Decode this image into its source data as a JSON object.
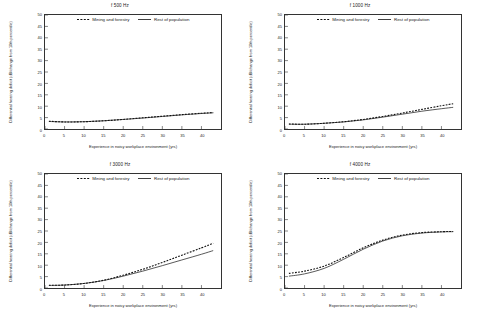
{
  "figure": {
    "legend": {
      "mining_label": "Mining and forestry",
      "rest_label": "Rest of population"
    },
    "axis": {
      "xlabel": "Experience in noisy workplace environment (yrs)",
      "ylabel": "Differential hearing deficit (dB/change from 10th percentile)",
      "xticks": [
        "0",
        "5",
        "10",
        "15",
        "20",
        "25",
        "30",
        "35",
        "40"
      ],
      "yticks": [
        "0",
        "5",
        "10",
        "15",
        "20",
        "25",
        "30",
        "35",
        "40",
        "45",
        "50"
      ]
    },
    "colors": {
      "line": "#111111",
      "frame": "#333333",
      "text": "#222222"
    }
  },
  "chart_data": [
    {
      "type": "line",
      "title": "f 500 Hz",
      "xlabel": "Experience in noisy workplace environment (yrs)",
      "ylabel": "Differential hearing deficit (dB/change from 10th percentile)",
      "xlim": [
        0,
        45
      ],
      "ylim": [
        0,
        50
      ],
      "grid": false,
      "legend_position": "top-center",
      "x": [
        1,
        5,
        10,
        15,
        20,
        25,
        30,
        35,
        40,
        43
      ],
      "series": [
        {
          "name": "Mining and forestry",
          "style": "dashed",
          "values": [
            3.4,
            3.1,
            3.2,
            3.6,
            4.2,
            4.9,
            5.6,
            6.3,
            6.9,
            7.2
          ]
        },
        {
          "name": "Rest of population",
          "style": "solid",
          "values": [
            3.3,
            3.1,
            3.2,
            3.6,
            4.2,
            4.8,
            5.5,
            6.2,
            6.8,
            7.1
          ]
        }
      ]
    },
    {
      "type": "line",
      "title": "f 1000 Hz",
      "xlabel": "Experience in noisy workplace environment (yrs)",
      "ylabel": "Differential hearing deficit (dB/change from 10th percentile)",
      "xlim": [
        0,
        45
      ],
      "ylim": [
        0,
        50
      ],
      "grid": false,
      "legend_position": "top-center",
      "x": [
        1,
        5,
        10,
        15,
        20,
        25,
        30,
        35,
        40,
        43
      ],
      "series": [
        {
          "name": "Mining and forestry",
          "style": "dashed",
          "values": [
            2.2,
            2.1,
            2.5,
            3.2,
            4.2,
            5.5,
            7.0,
            8.6,
            10.2,
            11.1
          ]
        },
        {
          "name": "Rest of population",
          "style": "solid",
          "values": [
            2.1,
            2.1,
            2.5,
            3.1,
            4.0,
            5.2,
            6.5,
            7.8,
            8.9,
            9.5
          ]
        }
      ]
    },
    {
      "type": "line",
      "title": "f 3000 Hz",
      "xlabel": "Experience in noisy workplace environment (yrs)",
      "ylabel": "Differential hearing deficit (dB/change from 10th percentile)",
      "xlim": [
        0,
        45
      ],
      "ylim": [
        0,
        50
      ],
      "grid": false,
      "legend_position": "top-center",
      "x": [
        1,
        5,
        10,
        15,
        20,
        25,
        30,
        35,
        40,
        43
      ],
      "series": [
        {
          "name": "Mining and forestry",
          "style": "dashed",
          "values": [
            1.2,
            1.3,
            2.0,
            3.4,
            5.6,
            8.2,
            11.2,
            14.4,
            17.6,
            19.6
          ]
        },
        {
          "name": "Rest of population",
          "style": "solid",
          "values": [
            1.1,
            1.3,
            2.0,
            3.3,
            5.2,
            7.4,
            9.8,
            12.3,
            14.8,
            16.4
          ]
        }
      ]
    },
    {
      "type": "line",
      "title": "f 4000 Hz",
      "xlabel": "Experience in noisy workplace environment (yrs)",
      "ylabel": "Differential hearing deficit (dB/change from 10th percentile)",
      "xlim": [
        0,
        45
      ],
      "ylim": [
        0,
        50
      ],
      "grid": false,
      "legend_position": "top-center",
      "x": [
        1,
        5,
        10,
        15,
        20,
        25,
        30,
        35,
        40,
        43
      ],
      "series": [
        {
          "name": "Mining and forestry",
          "style": "dashed",
          "values": [
            6.4,
            7.4,
            9.6,
            13.4,
            17.6,
            21.0,
            23.2,
            24.3,
            24.7,
            24.8
          ]
        },
        {
          "name": "Rest of population",
          "style": "solid",
          "values": [
            5.2,
            6.2,
            8.6,
            12.6,
            17.0,
            20.6,
            22.9,
            24.1,
            24.6,
            24.7
          ]
        }
      ]
    }
  ]
}
